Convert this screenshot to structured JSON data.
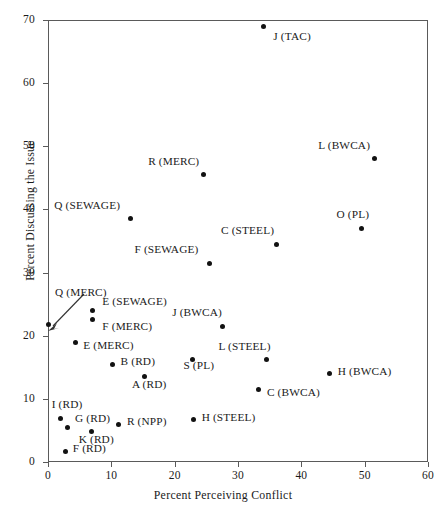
{
  "chart_data": {
    "type": "scatter",
    "title": "",
    "xlabel": "Percent Perceiving Conflict",
    "ylabel": "Percent Discussing the Issue",
    "xlim": [
      0,
      60
    ],
    "ylim": [
      0,
      70
    ],
    "xticks": [
      0,
      10,
      20,
      30,
      40,
      50,
      60
    ],
    "yticks": [
      0,
      10,
      20,
      30,
      40,
      50,
      60,
      70
    ],
    "grid": false,
    "legend": "none",
    "points": [
      {
        "label": "J (TAC)",
        "x": 34.0,
        "y": 69.0,
        "lx": 10,
        "ly": 10
      },
      {
        "label": "L (BWCA)",
        "x": 51.5,
        "y": 48.0,
        "lx": -30,
        "ly": -14
      },
      {
        "label": "R (MERC)",
        "x": 24.5,
        "y": 45.5,
        "lx": -30,
        "ly": -14
      },
      {
        "label": "O (PL)",
        "x": 49.5,
        "y": 37.0,
        "lx": -18,
        "ly": -14
      },
      {
        "label": "Q (SEWAGE)",
        "x": 13.0,
        "y": 38.5,
        "lx": -36,
        "ly": -14
      },
      {
        "label": "C (STEEL)",
        "x": 36.0,
        "y": 34.5,
        "lx": -28,
        "ly": -14
      },
      {
        "label": "F (SEWAGE)",
        "x": 25.5,
        "y": 31.5,
        "lx": -37,
        "ly": -14
      },
      {
        "label": "E (SEWAGE)",
        "x": 7.0,
        "y": 24.0,
        "lx": 10,
        "ly": -9
      },
      {
        "label": "F (MERC)",
        "x": 7.0,
        "y": 22.5,
        "lx": 10,
        "ly": 6
      },
      {
        "label": "Q (MERC)",
        "x": 0.0,
        "y": 21.7,
        "lx": 7,
        "ly": -33
      },
      {
        "label": "J (BWCA)",
        "x": 27.5,
        "y": 21.5,
        "lx": -26,
        "ly": -14
      },
      {
        "label": "E (MERC)",
        "x": 4.3,
        "y": 19.0,
        "lx": 8,
        "ly": 3
      },
      {
        "label": "L (STEEL)",
        "x": 34.5,
        "y": 16.2,
        "lx": -22,
        "ly": -14
      },
      {
        "label": "S (PL)",
        "x": 22.8,
        "y": 16.3,
        "lx": -4,
        "ly": 6
      },
      {
        "label": "B (RD)",
        "x": 10.2,
        "y": 15.5,
        "lx": 8,
        "ly": -3
      },
      {
        "label": "H (BWCA)",
        "x": 44.5,
        "y": 14.0,
        "lx": 8,
        "ly": -3
      },
      {
        "label": "A (RD)",
        "x": 15.3,
        "y": 13.5,
        "lx": -5,
        "ly": 7
      },
      {
        "label": "C (BWCA)",
        "x": 33.3,
        "y": 11.5,
        "lx": 8,
        "ly": 3
      },
      {
        "label": "I (RD)",
        "x": 2.0,
        "y": 6.9,
        "lx": -4,
        "ly": -14
      },
      {
        "label": "G (RD)",
        "x": 3.0,
        "y": 5.5,
        "lx": 8,
        "ly": -9
      },
      {
        "label": "H (STEEL)",
        "x": 23.0,
        "y": 6.7,
        "lx": 8,
        "ly": -3
      },
      {
        "label": "R (NPP)",
        "x": 11.2,
        "y": 6.0,
        "lx": 8,
        "ly": -3
      },
      {
        "label": "K (RD)",
        "x": 6.9,
        "y": 4.8,
        "lx": -4,
        "ly": 7
      },
      {
        "label": "F (RD)",
        "x": 2.8,
        "y": 1.6,
        "lx": 7,
        "ly": -4
      }
    ],
    "annotations": [
      {
        "name": "q-merc-callout-arrow",
        "from_label": "Q (MERC)",
        "to_point": "Q (MERC)"
      }
    ]
  },
  "colors": {
    "marker": "#121212",
    "axis": "#5a5a5a",
    "text": "#1a1a1a",
    "background": "#ffffff"
  }
}
